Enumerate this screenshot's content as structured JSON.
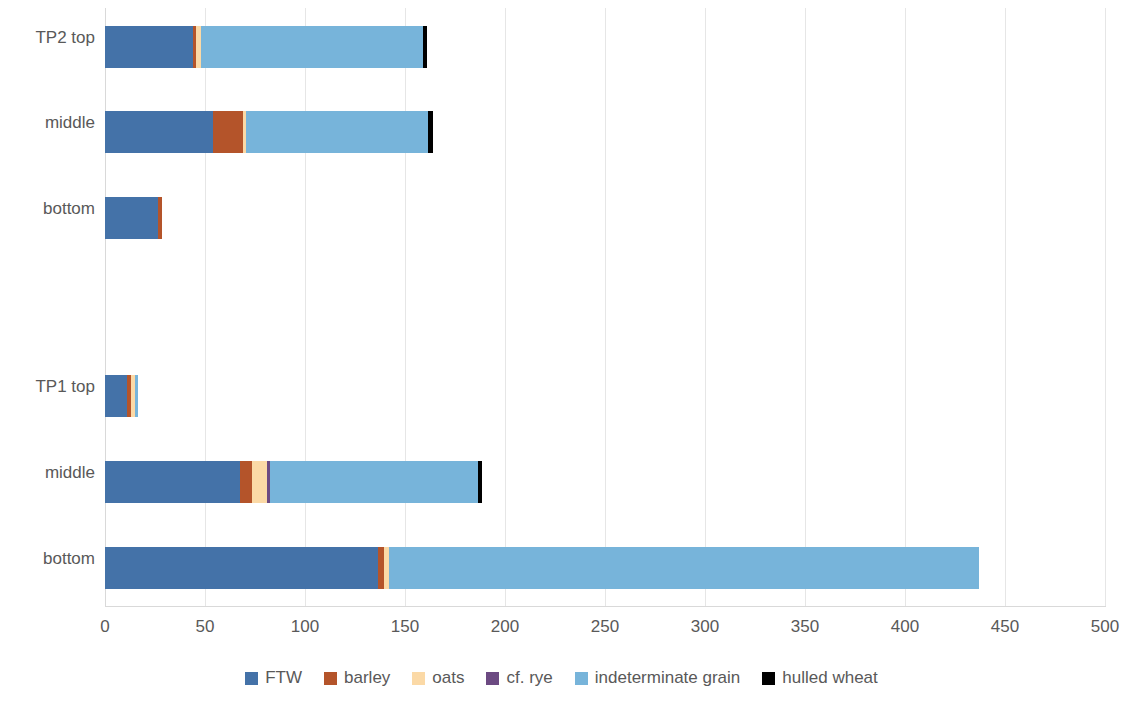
{
  "chart_data": {
    "type": "bar",
    "orientation": "horizontal",
    "stacked": true,
    "title": "",
    "xlabel": "",
    "ylabel": "",
    "xlim": [
      0,
      500
    ],
    "xticks": [
      0,
      50,
      100,
      150,
      200,
      250,
      300,
      350,
      400,
      450,
      500
    ],
    "xtick_labels": [
      "0",
      "50",
      "100",
      "150",
      "200",
      "250",
      "300",
      "350",
      "400",
      "450",
      "500"
    ],
    "grid": true,
    "grid_axis": "x",
    "legend_position": "bottom",
    "categories": [
      "bottom",
      "middle",
      "TP1 top",
      "",
      "bottom",
      "middle",
      "TP2 top"
    ],
    "category_display_order_top_to_bottom": [
      "TP2 top",
      "middle",
      "bottom",
      "",
      "TP1 top",
      "middle",
      "bottom"
    ],
    "series": [
      {
        "name": "FTW",
        "color": "#4472a8",
        "values_top_to_bottom": [
          44,
          54,
          26.5,
          0,
          11,
          67.5,
          136.5
        ]
      },
      {
        "name": "barley",
        "color": "#b4542a",
        "values_top_to_bottom": [
          1.5,
          15,
          2,
          0,
          2,
          6,
          3
        ]
      },
      {
        "name": "oats",
        "color": "#fbd9a6",
        "values_top_to_bottom": [
          2.5,
          1.5,
          0,
          0,
          2,
          7.5,
          2.5
        ]
      },
      {
        "name": "cf. rye",
        "color": "#6c4a82",
        "values_top_to_bottom": [
          0,
          0,
          0,
          0,
          0,
          1.5,
          0
        ]
      },
      {
        "name": "indeterminate grain",
        "color": "#77b4da",
        "values_top_to_bottom": [
          111,
          91,
          0,
          0,
          1.5,
          104,
          295
        ]
      },
      {
        "name": "hulled wheat",
        "color": "#000000",
        "values_top_to_bottom": [
          2,
          2.5,
          0,
          0,
          0,
          2,
          0
        ]
      }
    ],
    "totals_top_to_bottom": [
      161,
      164,
      28.5,
      0,
      16.5,
      188.5,
      437
    ]
  },
  "legend": {
    "items": [
      {
        "label": "FTW",
        "color": "#4472a8"
      },
      {
        "label": "barley",
        "color": "#b4542a"
      },
      {
        "label": "oats",
        "color": "#fbd9a6"
      },
      {
        "label": "cf. rye",
        "color": "#6c4a82"
      },
      {
        "label": "indeterminate grain",
        "color": "#77b4da"
      },
      {
        "label": "hulled wheat",
        "color": "#000000"
      }
    ]
  },
  "axis": {
    "x_tick_labels": [
      "0",
      "50",
      "100",
      "150",
      "200",
      "250",
      "300",
      "350",
      "400",
      "450",
      "500"
    ],
    "y_tick_labels": [
      "TP2 top",
      "middle",
      "bottom",
      "",
      "TP1 top",
      "middle",
      "bottom"
    ]
  }
}
